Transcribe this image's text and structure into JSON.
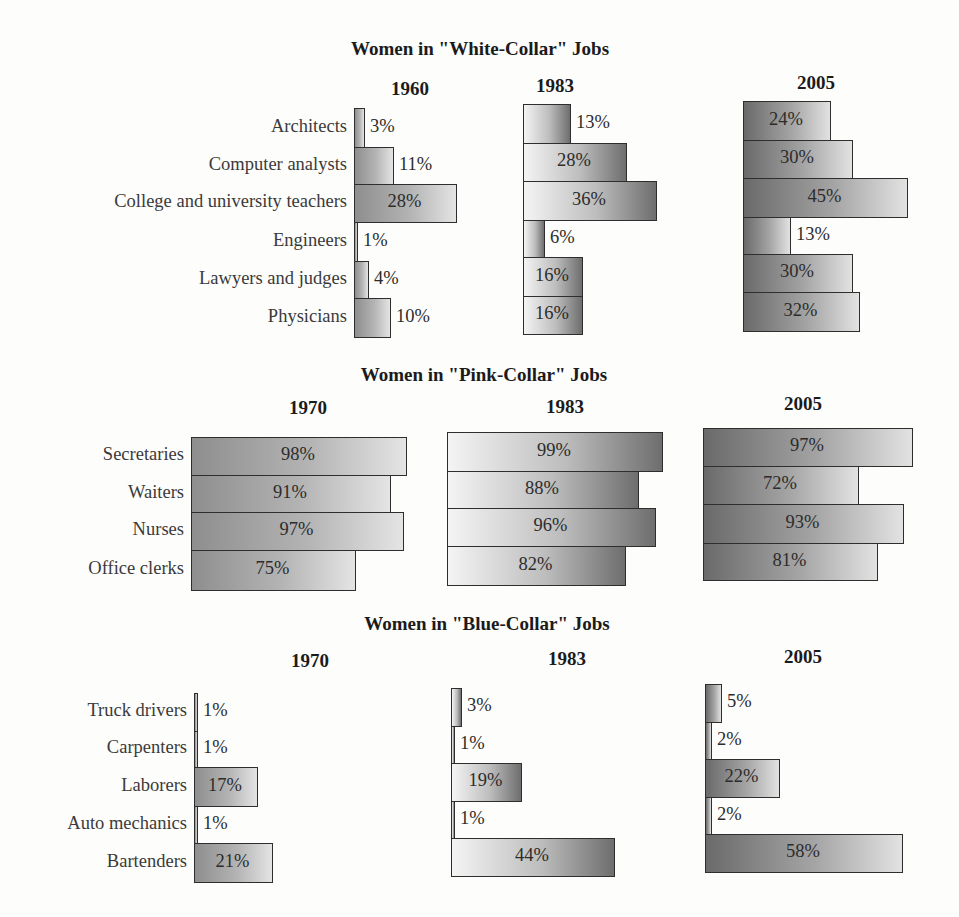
{
  "chart_data": [
    {
      "type": "bar",
      "orientation": "horizontal",
      "title": "Women in \"White-Collar\" Jobs",
      "categories": [
        "Architects",
        "Computer analysts",
        "College and university teachers",
        "Engineers",
        "Lawyers and judges",
        "Physicians"
      ],
      "series": [
        {
          "name": "1960",
          "values": [
            3,
            11,
            28,
            1,
            4,
            10
          ]
        },
        {
          "name": "1983",
          "values": [
            13,
            28,
            36,
            6,
            16,
            16
          ]
        },
        {
          "name": "2005",
          "values": [
            24,
            30,
            45,
            13,
            30,
            32
          ]
        }
      ],
      "value_suffix": "%",
      "xlabel": "",
      "ylabel": "",
      "grid": false,
      "legend": "none"
    },
    {
      "type": "bar",
      "orientation": "horizontal",
      "title": "Women in \"Pink-Collar\" Jobs",
      "categories": [
        "Secretaries",
        "Waiters",
        "Nurses",
        "Office clerks"
      ],
      "series": [
        {
          "name": "1970",
          "values": [
            98,
            91,
            97,
            75
          ]
        },
        {
          "name": "1983",
          "values": [
            99,
            88,
            96,
            82
          ]
        },
        {
          "name": "2005",
          "values": [
            97,
            72,
            93,
            81
          ]
        }
      ],
      "value_suffix": "%",
      "xlabel": "",
      "ylabel": "",
      "grid": false,
      "legend": "none"
    },
    {
      "type": "bar",
      "orientation": "horizontal",
      "title": "Women in \"Blue-Collar\" Jobs",
      "categories": [
        "Truck drivers",
        "Carpenters",
        "Laborers",
        "Auto mechanics",
        "Bartenders"
      ],
      "series": [
        {
          "name": "1970",
          "values": [
            1,
            1,
            17,
            1,
            21
          ]
        },
        {
          "name": "1983",
          "values": [
            3,
            1,
            19,
            1,
            44
          ]
        },
        {
          "name": "2005",
          "values": [
            5,
            2,
            22,
            2,
            58
          ]
        }
      ],
      "value_suffix": "%",
      "xlabel": "",
      "ylabel": "",
      "grid": false,
      "legend": "none"
    }
  ],
  "sections": {
    "white": {
      "title": "Women in \"White-Collar\" Jobs",
      "years": [
        "1960",
        "1983",
        "2005"
      ]
    },
    "pink": {
      "title": "Women in \"Pink-Collar\" Jobs",
      "years": [
        "1970",
        "1983",
        "2005"
      ]
    },
    "blue": {
      "title": "Women in \"Blue-Collar\" Jobs",
      "years": [
        "1970",
        "1983",
        "2005"
      ]
    }
  },
  "colors": {
    "bar_border": "#2e2e2e",
    "bar_dark": "#8e8e8e",
    "bar_light": "#e4e4e4",
    "text": "#2c2c2c",
    "background": "#fdfdfc"
  }
}
